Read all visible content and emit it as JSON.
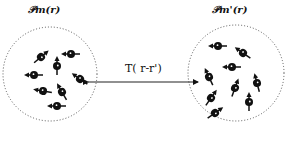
{
  "diagram": {
    "left_region": {
      "label": "𝒫m(r)",
      "center": [
        50,
        74
      ],
      "radius": 47,
      "particles": [
        {
          "x": 41,
          "y": 57,
          "angle": -40
        },
        {
          "x": 57,
          "y": 66,
          "angle": -90
        },
        {
          "x": 71,
          "y": 54,
          "angle": 180
        },
        {
          "x": 34,
          "y": 75,
          "angle": 180
        },
        {
          "x": 80,
          "y": 79,
          "angle": -145
        },
        {
          "x": 43,
          "y": 91,
          "angle": 190
        },
        {
          "x": 62,
          "y": 92,
          "angle": -120
        },
        {
          "x": 57,
          "y": 106,
          "angle": 180
        }
      ]
    },
    "right_region": {
      "label": "𝒫m'(r)",
      "center": [
        236,
        73
      ],
      "radius": 48,
      "particles": [
        {
          "x": 218,
          "y": 46,
          "angle": 180
        },
        {
          "x": 243,
          "y": 53,
          "angle": -145
        },
        {
          "x": 232,
          "y": 67,
          "angle": 180
        },
        {
          "x": 209,
          "y": 77,
          "angle": -115
        },
        {
          "x": 257,
          "y": 83,
          "angle": -105
        },
        {
          "x": 235,
          "y": 88,
          "angle": -70
        },
        {
          "x": 211,
          "y": 98,
          "angle": -55
        },
        {
          "x": 249,
          "y": 102,
          "angle": -90
        },
        {
          "x": 215,
          "y": 113,
          "angle": -35
        }
      ]
    },
    "interaction": {
      "label": "T( r-r')",
      "from": [
        88,
        82
      ],
      "to": [
        198,
        82
      ]
    },
    "colors": {
      "ink": "#111111",
      "dotted": "#555555",
      "background": "#ffffff"
    }
  }
}
